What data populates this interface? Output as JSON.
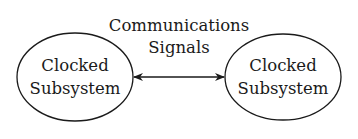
{
  "diagram": {
    "nodes": [
      {
        "id": "left",
        "line1": "Clocked",
        "line2": "Subsystem"
      },
      {
        "id": "right",
        "line1": "Clocked",
        "line2": "Subsystem"
      }
    ],
    "edge": {
      "label_line1": "Communications",
      "label_line2": "Signals",
      "direction": "bidirectional"
    },
    "colors": {
      "stroke": "#1a1a1a",
      "background": "#ffffff"
    }
  }
}
